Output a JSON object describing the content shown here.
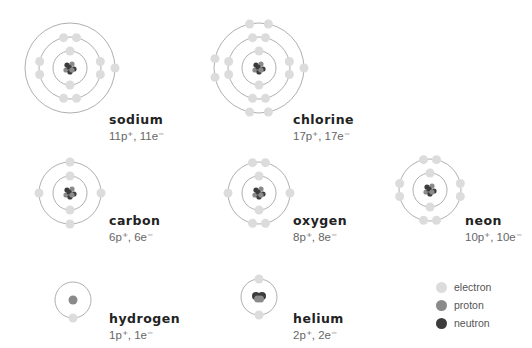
{
  "colors": {
    "electron": "#dcdcdc",
    "proton": "#8a8a8a",
    "neutron": "#3c3c3c",
    "orbit": "#9a9a9a"
  },
  "atoms": [
    {
      "name": "sodium",
      "protons": 11,
      "electrons": 11,
      "count_label": "11p⁺, 11e⁻",
      "cx": 70,
      "cy": 68,
      "shells": [
        2,
        8,
        1
      ],
      "label_x": 109,
      "label_y": 112
    },
    {
      "name": "chlorine",
      "protons": 17,
      "electrons": 17,
      "count_label": "17p⁺, 17e⁻",
      "cx": 259,
      "cy": 68,
      "shells": [
        2,
        8,
        7
      ],
      "label_x": 293,
      "label_y": 112
    },
    {
      "name": "carbon",
      "protons": 6,
      "electrons": 6,
      "count_label": "6p⁺, 6e⁻",
      "cx": 70,
      "cy": 193,
      "shells": [
        2,
        4
      ],
      "label_x": 109,
      "label_y": 213
    },
    {
      "name": "oxygen",
      "protons": 8,
      "electrons": 8,
      "count_label": "8p⁺, 8e⁻",
      "cx": 259,
      "cy": 193,
      "shells": [
        2,
        6
      ],
      "label_x": 293,
      "label_y": 213
    },
    {
      "name": "neon",
      "protons": 10,
      "electrons": 10,
      "count_label": "10p⁺, 10e⁻",
      "cx": 430,
      "cy": 190,
      "shells": [
        2,
        8
      ],
      "label_x": 465,
      "label_y": 213
    },
    {
      "name": "hydrogen",
      "protons": 1,
      "electrons": 1,
      "count_label": "1p⁺, 1e⁻",
      "cx": 73,
      "cy": 300,
      "shells": [
        1
      ],
      "label_x": 109,
      "label_y": 311
    },
    {
      "name": "helium",
      "protons": 2,
      "electrons": 2,
      "count_label": "2p⁺, 2e⁻",
      "cx": 259,
      "cy": 297,
      "shells": [
        2
      ],
      "label_x": 293,
      "label_y": 311
    }
  ],
  "legend": {
    "items": [
      {
        "label": "electron",
        "key": "electron"
      },
      {
        "label": "proton",
        "key": "proton"
      },
      {
        "label": "neutron",
        "key": "neutron"
      }
    ]
  }
}
